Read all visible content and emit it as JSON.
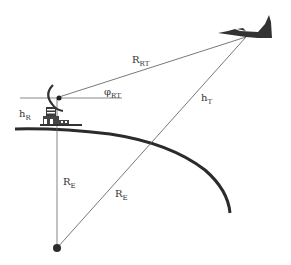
{
  "diagram": {
    "type": "radar-target geometry over curved earth",
    "colors": {
      "background": "#ffffff",
      "line": "#555555",
      "earth": "#2b2b2b",
      "aircraft": "#333333",
      "text": "#333333"
    },
    "labels": {
      "range": {
        "main": "R",
        "sub": "RT"
      },
      "elevation_angle": {
        "main": "φ",
        "sub": "RT"
      },
      "target_height": {
        "main": "h",
        "sub": "T"
      },
      "radar_height": {
        "main": "h",
        "sub": "R"
      },
      "earth_radius_vertical": {
        "main": "R",
        "sub": "E"
      },
      "earth_radius_diagonal": {
        "main": "R",
        "sub": "E"
      }
    },
    "elements": {
      "radar": "radar-antenna-icon",
      "target": "jet-aircraft-icon",
      "earth_center": "earth-center-dot",
      "earth_surface": "earth-curvature-arc"
    }
  }
}
